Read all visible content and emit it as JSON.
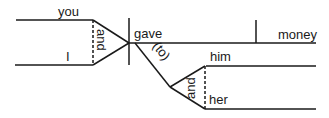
{
  "diagram": {
    "type": "sentence-diagram",
    "subjects": [
      "you",
      "I"
    ],
    "subject_conjunction": "and",
    "verb": "gave",
    "direct_object": "money",
    "indirect_preposition": "(to)",
    "indirect_objects": [
      "him",
      "her"
    ],
    "object_conjunction": "and",
    "line_color": "#1a1a1a"
  }
}
